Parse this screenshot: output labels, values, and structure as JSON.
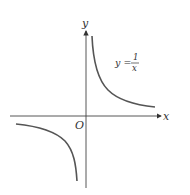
{
  "diagram": {
    "axes": {
      "x_label": "x",
      "y_label": "y",
      "origin_label": "O"
    },
    "equation": {
      "lhs": "y =",
      "numerator": "1",
      "denominator": "x"
    },
    "colors": {
      "axis": "#444444",
      "curve": "#555555",
      "text": "#333333"
    }
  }
}
